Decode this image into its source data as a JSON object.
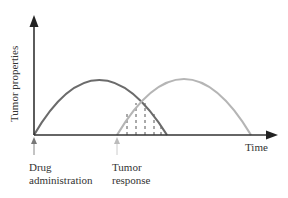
{
  "diagram": {
    "y_axis_label": "Tumor properties",
    "x_axis_label": "Time",
    "markers": [
      {
        "label_line1": "Drug",
        "label_line2": "administration"
      },
      {
        "label_line1": "Tumor",
        "label_line2": "response"
      }
    ],
    "curves": [
      {
        "name": "drug-effect-curve",
        "color": "#6b6b6b"
      },
      {
        "name": "tumor-response-curve",
        "color": "#b5b5b5"
      }
    ],
    "overlap_hatch": "dashed vertical lines",
    "colors": {
      "axis": "#333333",
      "drug_arrow": "#777777",
      "response_arrow": "#bbbbbb"
    }
  }
}
